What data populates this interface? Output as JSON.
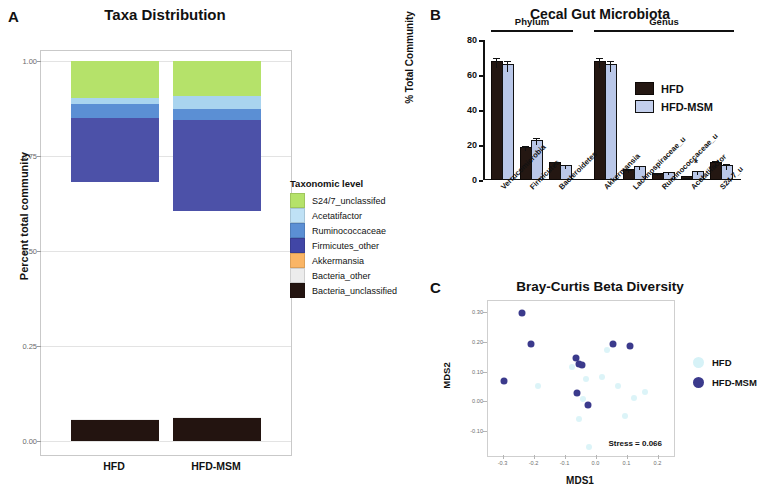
{
  "panelA": {
    "letter": "A",
    "title": "Taxa Distribution",
    "ylabel": "Percent total community",
    "legend_title": "Taxonomic level",
    "xlabels": [
      "HFD",
      "HFD-MSM"
    ],
    "yticks": [
      "1.00",
      "0.75",
      "0.50",
      "0.25",
      "0.00"
    ],
    "chart_data": {
      "type": "bar",
      "stacked": true,
      "title": "Taxa Distribution",
      "xlabel": "",
      "ylabel": "Percent total community",
      "ylim": [
        0,
        1
      ],
      "yticks": [
        0,
        0.25,
        0.5,
        0.75,
        1.0
      ],
      "grid": true,
      "legend_title": "Taxonomic level",
      "legend_position": "right",
      "categories": [
        "HFD",
        "HFD-MSM"
      ],
      "series": [
        {
          "name": "Bacteria_unclassified",
          "color": "#231410",
          "values": [
            0.055,
            0.06
          ]
        },
        {
          "name": "Bacteria_other",
          "color": "#f0f0f0",
          "values": [
            0.003,
            0.003
          ]
        },
        {
          "name": "Akkermansia",
          "color": "#f9b濾",
          "values": [
            0.623,
            0.543
          ]
        },
        {
          "name": "Firmicutes_other",
          "color": "#4c51a8",
          "values": [
            0.168,
            0.238
          ]
        },
        {
          "name": "Ruminococcaceae",
          "color": "#5b8fd4",
          "values": [
            0.038,
            0.03
          ]
        },
        {
          "name": "Acetatifactor",
          "color": "#a9d4ef",
          "values": [
            0.015,
            0.033
          ]
        },
        {
          "name": "S24/7_unclassifed",
          "color": "#b5e26a",
          "values": [
            0.098,
            0.093
          ]
        }
      ]
    },
    "legend_items": [
      {
        "label": "S24/7_unclassifed",
        "color": "#b5e26a"
      },
      {
        "label": "Acetatifactor",
        "color": "#bfe1f5"
      },
      {
        "label": "Ruminococcaceae",
        "color": "#5b8fd4"
      },
      {
        "label": "Firmicutes_other",
        "color": "#4146a6"
      },
      {
        "label": "Akkermansia",
        "color": "#fab565"
      },
      {
        "label": "Bacteria_other",
        "color": "#ececec"
      },
      {
        "label": "Bacteria_unclassified",
        "color": "#231410"
      }
    ]
  },
  "panelB": {
    "letter": "B",
    "title": "Cecal Gut Microbiota",
    "ylabel": "% Total Community",
    "group_labels": [
      "Phylum",
      "Genus"
    ],
    "yticks": [
      "80",
      "60",
      "40",
      "20",
      "0"
    ],
    "legend": [
      {
        "label": "HFD",
        "color": "#241712"
      },
      {
        "label": "HFD-MSM",
        "color": "#c3cfec"
      }
    ],
    "chart_data": {
      "type": "bar",
      "title": "Cecal Gut Microbiota",
      "xlabel": "",
      "ylabel": "% Total Community",
      "ylim": [
        0,
        80
      ],
      "yticks": [
        0,
        20,
        40,
        60,
        80
      ],
      "grid": false,
      "legend_position": "inside-right",
      "groups": [
        {
          "name": "Phylum",
          "categories": [
            "Verrucomicrobia",
            "Firmicutes",
            "Bacteroidetes"
          ]
        },
        {
          "name": "Genus",
          "categories": [
            "Akkermansia",
            "Lachnospiraceae_u",
            "Ruminococcaceae_u",
            "Acetatifactor",
            "S24-7_u"
          ]
        }
      ],
      "categories": [
        "Verrucomicrobia",
        "Firmicutes",
        "Bacteroidetes",
        "Akkermansia",
        "Lachnospiraceae_u",
        "Ruminococcaceae_u",
        "Acetatifactor",
        "S24-7_u"
      ],
      "series": [
        {
          "name": "HFD",
          "color": "#241712",
          "values": [
            67.0,
            18.0,
            9.0,
            67.0,
            5.0,
            3.0,
            1.0,
            9.0
          ],
          "errors": [
            3.0,
            1.2,
            1.5,
            3.0,
            1.0,
            0.8,
            0.4,
            2.0
          ]
        },
        {
          "name": "HFD-MSM",
          "color": "#b9c7e8",
          "values": [
            65.0,
            22.0,
            7.5,
            65.0,
            7.0,
            3.5,
            4.0,
            7.5
          ],
          "errors": [
            3.2,
            2.0,
            1.0,
            3.2,
            1.2,
            0.9,
            1.2,
            1.5
          ]
        }
      ],
      "significance": [
        {
          "category": "Acetatifactor",
          "series": "HFD-MSM",
          "marker": "*"
        }
      ]
    }
  },
  "panelC": {
    "letter": "C",
    "title": "Bray-Curtis Beta Diversity",
    "xlabel": "MDS1",
    "ylabel": "MDS2",
    "stress": "Stress = 0.066",
    "xticks": [
      "-0.3",
      "-0.2",
      "-0.1",
      "0.0",
      "0.1",
      "0.2"
    ],
    "yticks": [
      "0.30",
      "0.20",
      "0.10",
      "0.00",
      "-0.10"
    ],
    "legend": [
      {
        "label": "HFD",
        "color": "#d6f2f7"
      },
      {
        "label": "HFD-MSM",
        "color": "#3b3a8c"
      }
    ],
    "chart_data": {
      "type": "scatter",
      "title": "Bray-Curtis Beta Diversity",
      "xlabel": "MDS1",
      "ylabel": "MDS2",
      "xlim": [
        -0.35,
        0.25
      ],
      "ylim": [
        -0.18,
        0.34
      ],
      "xticks": [
        -0.3,
        -0.2,
        -0.1,
        0.0,
        0.1,
        0.2
      ],
      "yticks": [
        0.3,
        0.2,
        0.1,
        0.0,
        -0.1
      ],
      "grid": false,
      "annotation": "Stress = 0.066",
      "legend_position": "right",
      "series": [
        {
          "name": "HFD",
          "color": "#d6f2f7",
          "points": [
            [
              -0.19,
              0.055
            ],
            [
              -0.08,
              0.12
            ],
            [
              -0.045,
              0.012
            ],
            [
              -0.055,
              -0.055
            ],
            [
              -0.025,
              -0.15
            ],
            [
              -0.035,
              0.078
            ],
            [
              0.018,
              0.085
            ],
            [
              0.035,
              0.175
            ],
            [
              0.068,
              0.055
            ],
            [
              0.092,
              -0.045
            ],
            [
              0.12,
              0.015
            ],
            [
              0.155,
              0.035
            ]
          ]
        },
        {
          "name": "HFD-MSM",
          "color": "#3b3a8c",
          "points": [
            [
              -0.3,
              0.07
            ],
            [
              -0.24,
              0.3
            ],
            [
              -0.21,
              0.195
            ],
            [
              -0.065,
              0.15
            ],
            [
              -0.055,
              0.128
            ],
            [
              -0.048,
              0.125
            ],
            [
              -0.062,
              0.03
            ],
            [
              -0.028,
              -0.01
            ],
            [
              0.052,
              0.195
            ],
            [
              0.108,
              0.188
            ]
          ]
        }
      ]
    }
  }
}
